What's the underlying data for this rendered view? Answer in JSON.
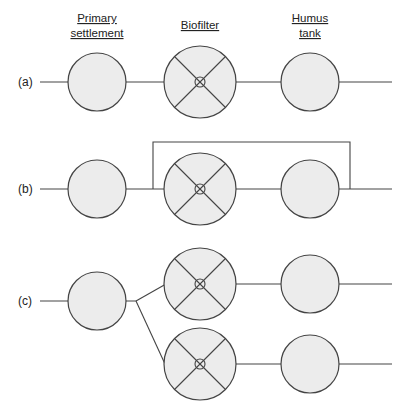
{
  "headers": {
    "primary": [
      "Primary",
      "settlement"
    ],
    "biofilter": [
      "Biofilter"
    ],
    "humus": [
      "Humus",
      "tank"
    ]
  },
  "rows": [
    {
      "label": "(a)",
      "config": "single-stage series"
    },
    {
      "label": "(b)",
      "config": "series with recirculation loop"
    },
    {
      "label": "(c)",
      "config": "parallel biofilters"
    }
  ],
  "colors": {
    "fill": "#ececec",
    "stroke": "#444444",
    "text": "#222222"
  }
}
